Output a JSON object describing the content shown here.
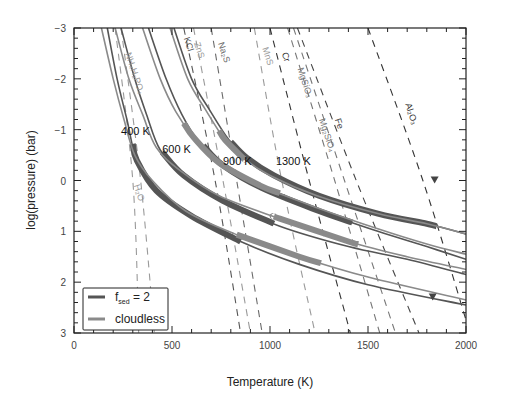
{
  "chart_data": {
    "type": "line",
    "title": "",
    "xlabel": "Temperature (K)",
    "ylabel": "log(pressure) (bar)",
    "xlim": [
      0,
      2000
    ],
    "ylim": [
      -3,
      3
    ],
    "y_inverted": true,
    "x_ticks": [
      0,
      500,
      1000,
      1500,
      2000
    ],
    "y_ticks": [
      -3,
      -2,
      -1,
      0,
      1,
      2,
      3
    ],
    "grid": false,
    "legend_position": "lower left",
    "legend": [
      {
        "label": "f_sed = 2",
        "color": "#555555",
        "style": "solid-dark"
      },
      {
        "label": "cloudless",
        "color": "#8a8a8a",
        "style": "solid-light"
      }
    ],
    "profile_labels": [
      {
        "text": "400 K",
        "T": 240,
        "P": -0.9
      },
      {
        "text": "600 K",
        "T": 450,
        "P": -0.55
      },
      {
        "text": "900 K",
        "T": 760,
        "P": -0.3
      },
      {
        "text": "1300 K",
        "T": 1030,
        "P": -0.3
      }
    ],
    "profiles": [
      {
        "teff": "400 K",
        "cloud": "f_sed = 2",
        "points": [
          [
            170,
            -3
          ],
          [
            220,
            -2
          ],
          [
            270,
            -1.2
          ],
          [
            320,
            -0.4
          ],
          [
            420,
            0.2
          ],
          [
            600,
            0.7
          ],
          [
            850,
            1.2
          ],
          [
            1150,
            1.65
          ],
          [
            1500,
            2.05
          ],
          [
            2000,
            2.45
          ]
        ],
        "thick_range": [
          300,
          850
        ]
      },
      {
        "teff": "400 K",
        "cloud": "cloudless",
        "points": [
          [
            140,
            -3
          ],
          [
            200,
            -2
          ],
          [
            255,
            -1.2
          ],
          [
            310,
            -0.5
          ],
          [
            400,
            0.0
          ],
          [
            570,
            0.6
          ],
          [
            820,
            1.05
          ],
          [
            1150,
            1.5
          ],
          [
            1500,
            1.9
          ],
          [
            2000,
            2.35
          ]
        ],
        "thick_range": [
          830,
          1260
        ]
      },
      {
        "teff": "600 K",
        "cloud": "f_sed = 2",
        "points": [
          [
            240,
            -3
          ],
          [
            310,
            -2
          ],
          [
            370,
            -1.3
          ],
          [
            440,
            -0.6
          ],
          [
            560,
            -0.1
          ],
          [
            760,
            0.4
          ],
          [
            1050,
            0.9
          ],
          [
            1400,
            1.3
          ],
          [
            1700,
            1.55
          ],
          [
            2000,
            1.85
          ]
        ],
        "thick_range": [
          450,
          1020
        ]
      },
      {
        "teff": "600 K",
        "cloud": "cloudless",
        "points": [
          [
            210,
            -3
          ],
          [
            280,
            -2
          ],
          [
            350,
            -1.3
          ],
          [
            420,
            -0.65
          ],
          [
            540,
            -0.2
          ],
          [
            740,
            0.3
          ],
          [
            1050,
            0.75
          ],
          [
            1400,
            1.2
          ],
          [
            1700,
            1.5
          ],
          [
            2000,
            1.75
          ]
        ],
        "thick_range": [
          1020,
          1450
        ]
      },
      {
        "teff": "900 K",
        "cloud": "f_sed = 2",
        "points": [
          [
            380,
            -3
          ],
          [
            470,
            -2
          ],
          [
            550,
            -1.3
          ],
          [
            630,
            -0.8
          ],
          [
            760,
            -0.3
          ],
          [
            960,
            0.15
          ],
          [
            1250,
            0.6
          ],
          [
            1550,
            1.0
          ],
          [
            1800,
            1.3
          ],
          [
            2000,
            1.55
          ]
        ],
        "thick_range": [
          660,
          1420
        ]
      },
      {
        "teff": "900 K",
        "cloud": "cloudless",
        "points": [
          [
            350,
            -3
          ],
          [
            440,
            -2
          ],
          [
            520,
            -1.35
          ],
          [
            610,
            -0.85
          ],
          [
            740,
            -0.35
          ],
          [
            950,
            0.1
          ],
          [
            1250,
            0.55
          ],
          [
            1550,
            0.95
          ],
          [
            1800,
            1.25
          ],
          [
            2000,
            1.45
          ]
        ],
        "thick_range": [
          560,
          1050
        ]
      },
      {
        "teff": "1300 K",
        "cloud": "f_sed = 2",
        "points": [
          [
            510,
            -3
          ],
          [
            600,
            -2
          ],
          [
            690,
            -1.4
          ],
          [
            790,
            -0.8
          ],
          [
            880,
            -0.45
          ],
          [
            1020,
            -0.1
          ],
          [
            1250,
            0.3
          ],
          [
            1550,
            0.65
          ],
          [
            1800,
            0.85
          ],
          [
            2000,
            1.05
          ]
        ],
        "thick_range": [
          800,
          1850
        ]
      },
      {
        "teff": "1300 K",
        "cloud": "cloudless",
        "points": [
          [
            490,
            -3
          ],
          [
            580,
            -2
          ],
          [
            670,
            -1.4
          ],
          [
            770,
            -0.8
          ],
          [
            860,
            -0.45
          ],
          [
            1000,
            -0.1
          ],
          [
            1240,
            0.3
          ],
          [
            1550,
            0.65
          ],
          [
            1800,
            0.85
          ],
          [
            2000,
            1.05
          ]
        ],
        "thick_range": [
          740,
          870
        ]
      }
    ],
    "condensation_curves": [
      {
        "species": "H2O",
        "label": "H₂O",
        "color": "#9a9a9a",
        "T_at_P": [
          [
            210,
            -3
          ],
          [
            300,
            0
          ],
          [
            330,
            3
          ]
        ],
        "label_T": 305,
        "label_P": 0.1
      },
      {
        "species": "NH4H2PO4",
        "label": "NH₄H₂PO₄",
        "color": "#9a9a9a",
        "T_at_P": [
          [
            240,
            -3
          ],
          [
            340,
            0
          ],
          [
            410,
            3
          ]
        ],
        "label_T": 262,
        "label_P": -2.5
      },
      {
        "species": "KCl",
        "label": "KCl",
        "color": "#555555",
        "T_at_P": [
          [
            560,
            -3
          ],
          [
            720,
            0
          ],
          [
            850,
            3
          ]
        ],
        "label_T": 560,
        "label_P": -2.8
      },
      {
        "species": "ZnS",
        "label": "ZnS",
        "color": "#9a9a9a",
        "T_at_P": [
          [
            610,
            -3
          ],
          [
            760,
            0
          ],
          [
            900,
            3
          ]
        ],
        "label_T": 612,
        "label_P": -2.7
      },
      {
        "species": "Na2S",
        "label": "Na₂S",
        "color": "#6a6a6a",
        "T_at_P": [
          [
            700,
            -3
          ],
          [
            830,
            0
          ],
          [
            960,
            3
          ]
        ],
        "label_T": 735,
        "label_P": -2.7
      },
      {
        "species": "MnS",
        "label": "MnS",
        "color": "#9a9a9a",
        "T_at_P": [
          [
            920,
            -3
          ],
          [
            1060,
            0
          ],
          [
            1230,
            3
          ]
        ],
        "label_T": 960,
        "label_P": -2.6
      },
      {
        "species": "Cr",
        "label": "Cr",
        "color": "#333333",
        "T_at_P": [
          [
            1000,
            -3
          ],
          [
            1200,
            0
          ],
          [
            1410,
            3
          ]
        ],
        "label_T": 1060,
        "label_P": -2.5
      },
      {
        "species": "MgSiO3",
        "label": "MgSiO₃",
        "color": "#777777",
        "T_at_P": [
          [
            1090,
            -3
          ],
          [
            1330,
            0
          ],
          [
            1560,
            3
          ]
        ],
        "label_T": 1140,
        "label_P": -2.2
      },
      {
        "species": "Mg2SiO4",
        "label": "Mg₂SiO₄",
        "color": "#777777",
        "T_at_P": [
          [
            1120,
            -3
          ],
          [
            1380,
            0
          ],
          [
            1640,
            3
          ]
        ],
        "label_T": 1250,
        "label_P": -1.2
      },
      {
        "species": "Fe",
        "label": "Fe",
        "color": "#444444",
        "T_at_P": [
          [
            1140,
            -3
          ],
          [
            1440,
            0
          ],
          [
            1760,
            3
          ]
        ],
        "label_T": 1330,
        "label_P": -1.2
      },
      {
        "species": "Al2O3",
        "label": "Al₂O₃",
        "color": "#333333",
        "T_at_P": [
          [
            1500,
            -3
          ],
          [
            1780,
            0
          ],
          [
            2020,
            3
          ]
        ],
        "label_T": 1690,
        "label_P": -1.5
      }
    ],
    "markers": [
      {
        "shape": "triangle-down",
        "T": 1840,
        "P": 0.0,
        "color": "#444444"
      },
      {
        "shape": "triangle-down",
        "T": 1830,
        "P": 2.3,
        "color": "#444444"
      }
    ]
  },
  "axes": {
    "xlabel": "Temperature (K)",
    "ylabel": "log(pressure) (bar)",
    "x_tick_labels": [
      "0",
      "500",
      "1000",
      "1500",
      "2000"
    ],
    "y_tick_labels": [
      "-3",
      "-2",
      "-1",
      "0",
      "1",
      "2",
      "3"
    ]
  },
  "legend": {
    "item1_main": "f",
    "item1_sub": "sed",
    "item1_rest": " = 2",
    "item2": "cloudless"
  }
}
